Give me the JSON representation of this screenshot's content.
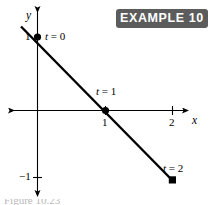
{
  "badge": {
    "label": "EXAMPLE 10",
    "background": "#5c5c5c",
    "text_color": "#ffffff"
  },
  "chart_data": {
    "type": "line",
    "title": "",
    "xlabel": "x",
    "ylabel": "y",
    "xlim": [
      -1.2,
      2.6
    ],
    "ylim": [
      -1.45,
      1.75
    ],
    "grid": false,
    "legend": "none",
    "line_color": "#000000",
    "axis_color": "#000000",
    "x_ticks": [
      1,
      2
    ],
    "x_tick_labels": [
      "1",
      "2"
    ],
    "y_ticks": [
      1,
      -1
    ],
    "y_tick_labels": [
      "1",
      "-1"
    ],
    "series": [
      {
        "name": "parametric-line",
        "x": [
          0,
          1,
          2
        ],
        "y": [
          1,
          0,
          -1
        ],
        "point_labels": [
          "t = 0",
          "t = 1",
          "t = 2"
        ],
        "marker_shapes": [
          "circle",
          "circle",
          "square"
        ],
        "line_extends_before_start": true
      }
    ],
    "annotations": [
      {
        "text": "t = 0",
        "x": 0,
        "y": 1
      },
      {
        "text": "t = 1",
        "x": 1,
        "y": 0
      },
      {
        "text": "t = 2",
        "x": 2,
        "y": -1
      }
    ]
  },
  "labels": {
    "y_axis": "y",
    "x_axis": "x",
    "y_one": "1",
    "y_neg_one": "−1",
    "x_one": "1",
    "x_two": "2",
    "t0": "t = 0",
    "t1": "t = 1",
    "t2": "t = 2"
  },
  "caption": {
    "text": "Figure 10.23"
  }
}
